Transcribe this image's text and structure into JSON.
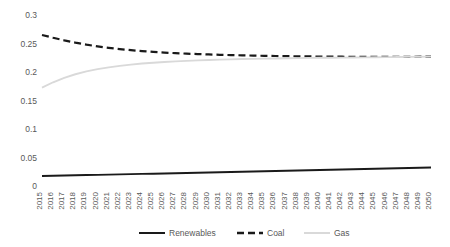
{
  "chart_data": {
    "type": "line",
    "title": "",
    "subtitle": "",
    "xlabel": "",
    "ylabel": "",
    "grid": false,
    "legend_position": "bottom",
    "ylim": [
      0,
      0.3
    ],
    "yticks": [
      "0",
      "0.05",
      "0.1",
      "0.15",
      "0.2",
      "0.25",
      "0.3"
    ],
    "ytick_values": [
      0,
      0.05,
      0.1,
      0.15,
      0.2,
      0.25,
      0.3
    ],
    "categories": [
      "2015",
      "2016",
      "2017",
      "2018",
      "2019",
      "2020",
      "2021",
      "2022",
      "2023",
      "2024",
      "2025",
      "2026",
      "2027",
      "2028",
      "2029",
      "2030",
      "2031",
      "2032",
      "2033",
      "2034",
      "2035",
      "2036",
      "2037",
      "2038",
      "2039",
      "2040",
      "2041",
      "2042",
      "2043",
      "2044",
      "2045",
      "2046",
      "2047",
      "2048",
      "2049",
      "2050"
    ],
    "series": [
      {
        "name": "Renewables",
        "color": "#1a1a1a",
        "style": "solid",
        "values": [
          0.0175,
          0.018,
          0.0184,
          0.0188,
          0.0192,
          0.0196,
          0.02,
          0.0204,
          0.0208,
          0.0212,
          0.0216,
          0.022,
          0.0225,
          0.0229,
          0.0233,
          0.0237,
          0.0242,
          0.0246,
          0.025,
          0.0254,
          0.0259,
          0.0263,
          0.0267,
          0.0271,
          0.0276,
          0.028,
          0.0284,
          0.0289,
          0.0293,
          0.0297,
          0.0302,
          0.0306,
          0.0311,
          0.0315,
          0.032,
          0.0325
        ]
      },
      {
        "name": "Coal",
        "color": "#1a1a1a",
        "style": "dashed",
        "values": [
          0.265,
          0.26,
          0.2555,
          0.2515,
          0.248,
          0.245,
          0.2424,
          0.2402,
          0.2383,
          0.2367,
          0.2353,
          0.2341,
          0.2331,
          0.2322,
          0.2315,
          0.2308,
          0.2302,
          0.2297,
          0.2292,
          0.2288,
          0.2284,
          0.2281,
          0.2278,
          0.2275,
          0.2273,
          0.2271,
          0.2269,
          0.2268,
          0.2267,
          0.2266,
          0.2266,
          0.2266,
          0.2266,
          0.2267,
          0.2268,
          0.227
        ]
      },
      {
        "name": "Gas",
        "color": "#d9d9d9",
        "style": "solid",
        "values": [
          0.1725,
          0.182,
          0.1898,
          0.196,
          0.201,
          0.205,
          0.2082,
          0.2108,
          0.213,
          0.2148,
          0.2163,
          0.2176,
          0.2187,
          0.2196,
          0.2204,
          0.2211,
          0.2217,
          0.2222,
          0.2227,
          0.2231,
          0.2235,
          0.2238,
          0.2241,
          0.2244,
          0.2247,
          0.2249,
          0.2251,
          0.2253,
          0.2255,
          0.2257,
          0.2259,
          0.2261,
          0.2263,
          0.2265,
          0.2267,
          0.227
        ]
      }
    ]
  },
  "legend": {
    "items": [
      {
        "label": "Renewables",
        "color": "#1a1a1a",
        "style": "solid"
      },
      {
        "label": "Coal",
        "color": "#1a1a1a",
        "style": "dashed"
      },
      {
        "label": "Gas",
        "color": "#d9d9d9",
        "style": "solid"
      }
    ]
  }
}
